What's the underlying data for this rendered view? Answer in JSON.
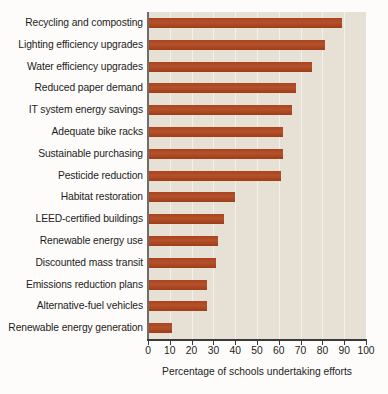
{
  "chart_data": {
    "type": "bar",
    "orientation": "horizontal",
    "title": "",
    "subtitle": "",
    "xlabel": "Percentage of schools undertaking efforts",
    "ylabel": "",
    "xlim": [
      0,
      100
    ],
    "xticks": [
      0,
      10,
      20,
      30,
      40,
      50,
      60,
      70,
      80,
      90,
      100
    ],
    "grid": true,
    "grid_axis": "x",
    "legend": false,
    "legend_position": "none",
    "categories": [
      "Recycling and composting",
      "Lighting efficiency upgrades",
      "Water efficiency upgrades",
      "Reduced paper demand",
      "IT system energy savings",
      "Adequate bike racks",
      "Sustainable purchasing",
      "Pesticide reduction",
      "Habitat restoration",
      "LEED-certified buildings",
      "Renewable energy use",
      "Discounted mass transit",
      "Emissions reduction plans",
      "Alternative-fuel vehicles",
      "Renewable energy generation"
    ],
    "values": [
      89,
      81,
      75,
      68,
      66,
      62,
      62,
      61,
      40,
      35,
      32,
      31,
      27,
      27,
      11
    ],
    "bar_color": "#a9441f",
    "plot_background": "#e7e0d4",
    "axis_color": "#3a3a38"
  }
}
